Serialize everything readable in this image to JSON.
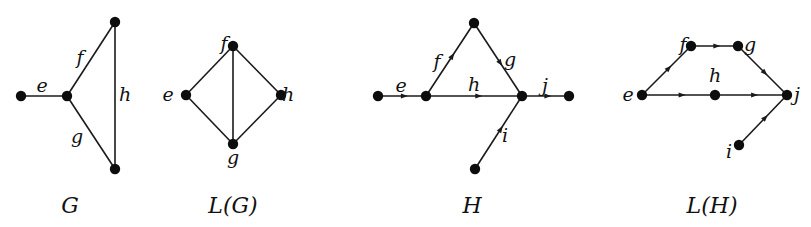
{
  "figure": {
    "graphs": [
      {
        "id": "G",
        "caption": "G",
        "caption_pos": [
          70,
          213
        ],
        "directed": false,
        "nodes": [
          {
            "id": "g1",
            "x": 21,
            "y": 96
          },
          {
            "id": "g2",
            "x": 67,
            "y": 96
          },
          {
            "id": "g3",
            "x": 115,
            "y": 22
          },
          {
            "id": "g4",
            "x": 115,
            "y": 169
          }
        ],
        "edges": [
          {
            "label": "e",
            "from": "g1",
            "to": "g2",
            "label_pos": [
              42,
              92
            ]
          },
          {
            "label": "f",
            "from": "g2",
            "to": "g3",
            "label_pos": [
              80,
              64
            ]
          },
          {
            "label": "g",
            "from": "g2",
            "to": "g4",
            "label_pos": [
              77,
              143
            ]
          },
          {
            "label": "h",
            "from": "g3",
            "to": "g4",
            "label_pos": [
              125,
              101
            ]
          }
        ]
      },
      {
        "id": "LG",
        "caption": "L(G)",
        "caption_pos": [
          233,
          213
        ],
        "directed": false,
        "nodes": [
          {
            "id": "f",
            "x": 233,
            "y": 46,
            "label": "f",
            "label_pos": [
              224,
              50
            ]
          },
          {
            "id": "e",
            "x": 186,
            "y": 95,
            "label": "e",
            "label_pos": [
              168,
              101
            ]
          },
          {
            "id": "h",
            "x": 281,
            "y": 95,
            "label": "h",
            "label_pos": [
              288,
              101
            ]
          },
          {
            "id": "g",
            "x": 233,
            "y": 144,
            "label": "g",
            "label_pos": [
              233,
              164
            ]
          }
        ],
        "edges": [
          {
            "from": "e",
            "to": "f"
          },
          {
            "from": "f",
            "to": "h"
          },
          {
            "from": "e",
            "to": "g"
          },
          {
            "from": "h",
            "to": "g"
          },
          {
            "from": "f",
            "to": "g"
          }
        ]
      },
      {
        "id": "H",
        "caption": "H",
        "caption_pos": [
          472,
          213
        ],
        "directed": true,
        "nodes": [
          {
            "id": "h1",
            "x": 378,
            "y": 96
          },
          {
            "id": "h2",
            "x": 426,
            "y": 96
          },
          {
            "id": "h3",
            "x": 474,
            "y": 23
          },
          {
            "id": "h4",
            "x": 522,
            "y": 96
          },
          {
            "id": "h5",
            "x": 569,
            "y": 96
          },
          {
            "id": "h6",
            "x": 475,
            "y": 169
          }
        ],
        "edges": [
          {
            "label": "e",
            "from": "h1",
            "to": "h2",
            "label_pos": [
              401,
              92
            ]
          },
          {
            "label": "f",
            "from": "h2",
            "to": "h3",
            "label_pos": [
              437,
              68
            ]
          },
          {
            "label": "g",
            "from": "h3",
            "to": "h4",
            "label_pos": [
              510,
              66
            ]
          },
          {
            "label": "h",
            "from": "h2",
            "to": "h4",
            "label_pos": [
              474,
              91
            ]
          },
          {
            "label": "j",
            "from": "h4",
            "to": "h5",
            "label_pos": [
              545,
              92
            ]
          },
          {
            "label": "i",
            "from": "h6",
            "to": "h4",
            "label_pos": [
              505,
              142
            ]
          }
        ]
      },
      {
        "id": "LH",
        "caption": "L(H)",
        "caption_pos": [
          712,
          213
        ],
        "directed": true,
        "nodes": [
          {
            "id": "f",
            "x": 691,
            "y": 46,
            "label": "f",
            "label_pos": [
              683,
              51
            ]
          },
          {
            "id": "g",
            "x": 738,
            "y": 46,
            "label": "g",
            "label_pos": [
              750,
              51
            ]
          },
          {
            "id": "e",
            "x": 642,
            "y": 95,
            "label": "e",
            "label_pos": [
              628,
              101
            ]
          },
          {
            "id": "h",
            "x": 715,
            "y": 95,
            "label": "h",
            "label_pos": [
              715,
              82
            ]
          },
          {
            "id": "j",
            "x": 787,
            "y": 95,
            "label": "j",
            "label_pos": [
              797,
              101
            ]
          },
          {
            "id": "i",
            "x": 739,
            "y": 145,
            "label": "i",
            "label_pos": [
              729,
              158
            ]
          }
        ],
        "edges": [
          {
            "from": "e",
            "to": "f"
          },
          {
            "from": "f",
            "to": "g"
          },
          {
            "from": "g",
            "to": "j"
          },
          {
            "from": "e",
            "to": "h"
          },
          {
            "from": "h",
            "to": "j"
          },
          {
            "from": "i",
            "to": "j"
          }
        ]
      }
    ],
    "colors": {
      "background": "#ffffff",
      "ink": "#111111"
    }
  }
}
